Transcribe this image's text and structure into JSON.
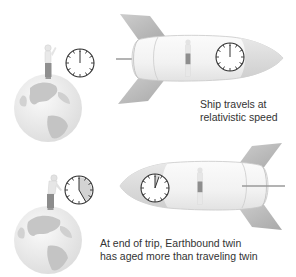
{
  "diagram": {
    "panels": [
      {
        "id": "departure",
        "caption_lines": [
          "Ship travels at",
          "relativistic speed"
        ],
        "earth_clock": {
          "hand": "12 o'clock",
          "elapsed_fraction": 0.0
        },
        "ship_clock": {
          "hand": "12 o'clock",
          "elapsed_fraction": 0.0
        }
      },
      {
        "id": "return",
        "caption_lines": [
          "At end of trip, Earthbound twin",
          "has aged more than traveling twin"
        ],
        "earth_clock": {
          "hand": "about 5 o'clock",
          "elapsed_fraction": 0.42
        },
        "ship_clock": {
          "hand": "about 1 o'clock",
          "elapsed_fraction": 0.06
        }
      }
    ],
    "colors": {
      "background": "#ffffff",
      "rocket_body": "#f4f4f4",
      "rocket_nose": "#d9d9d9",
      "rocket_fin": "#b8b8b8",
      "earth_ocean": "#ececec",
      "earth_land": "#c9c9c9",
      "clock_stroke": "#333333",
      "clock_elapsed": "#cfcfcf",
      "caption_text": "#333333"
    },
    "icons": [
      "earth-globe-icon",
      "person-icon",
      "clock-icon",
      "rocket-icon"
    ]
  }
}
